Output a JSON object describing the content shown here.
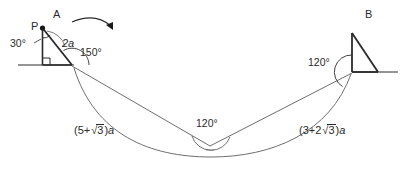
{
  "diagram": {
    "stroke_color": "#2b2b2b",
    "stroke_color_light": "#6e6e6e",
    "background": "#ffffff",
    "points": {
      "p_label": "P",
      "a_label": "A",
      "b_label": "B"
    },
    "angles": {
      "apex_p": "30°",
      "vertex_left": "150°",
      "vertex_right": "120°",
      "center": "120°"
    },
    "lengths": {
      "hypotenuse_left": "2a",
      "chord_left_prefix": "(5+",
      "chord_left_radicand": "3",
      "chord_left_suffix": ")",
      "chord_left_unit": "a",
      "chord_right_prefix": "(3+2",
      "chord_right_radicand": "3",
      "chord_right_suffix": ")",
      "chord_right_unit": "a"
    },
    "annotations": {
      "rotation_arrow": "rotation-direction-arrow",
      "right_angle_marker": "right-angle-square"
    }
  }
}
